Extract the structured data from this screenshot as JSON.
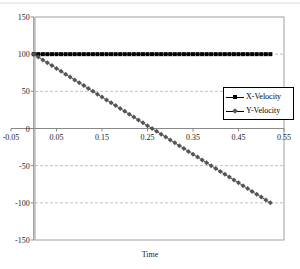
{
  "chart_data": {
    "type": "line",
    "title": "",
    "xlabel": "Time",
    "ylabel": "",
    "xlim": [
      -0.05,
      0.55
    ],
    "ylim": [
      -150,
      150
    ],
    "x_ticks": [
      -0.05,
      0.05,
      0.15,
      0.25,
      0.35,
      0.45,
      0.55
    ],
    "x_tick_labels": [
      "-0.05",
      "0.05",
      "0.15",
      "0.25",
      "0.35",
      "0.45",
      "0.55"
    ],
    "y_ticks": [
      -150,
      -100,
      -50,
      0,
      50,
      100,
      150
    ],
    "y_tick_labels": [
      "-150",
      "-100",
      "-50",
      "0",
      "50",
      "100",
      "150"
    ],
    "grid": {
      "horizontal": true,
      "style": "dashed",
      "color": "#b0b0b0"
    },
    "legend_position": "right-middle",
    "x": [
      0.0,
      0.01,
      0.02,
      0.03,
      0.04,
      0.05,
      0.06,
      0.07,
      0.08,
      0.09,
      0.1,
      0.11,
      0.12,
      0.13,
      0.14,
      0.15,
      0.16,
      0.17,
      0.18,
      0.19,
      0.2,
      0.21,
      0.22,
      0.23,
      0.24,
      0.25,
      0.26,
      0.27,
      0.28,
      0.29,
      0.3,
      0.31,
      0.32,
      0.33,
      0.34,
      0.35,
      0.36,
      0.37,
      0.38,
      0.39,
      0.4,
      0.41,
      0.42,
      0.43,
      0.44,
      0.45,
      0.46,
      0.47,
      0.48,
      0.49,
      0.5,
      0.51,
      0.52
    ],
    "series": [
      {
        "name": "X-Velocity",
        "marker": "square",
        "color": "#000000",
        "values": [
          100,
          100,
          100,
          100,
          100,
          100,
          100,
          100,
          100,
          100,
          100,
          100,
          100,
          100,
          100,
          100,
          100,
          100,
          100,
          100,
          100,
          100,
          100,
          100,
          100,
          100,
          100,
          100,
          100,
          100,
          100,
          100,
          100,
          100,
          100,
          100,
          100,
          100,
          100,
          100,
          100,
          100,
          100,
          100,
          100,
          100,
          100,
          100,
          100,
          100,
          100,
          100,
          100
        ]
      },
      {
        "name": "Y-Velocity",
        "marker": "diamond",
        "color": "#555555",
        "values": [
          100.0,
          96.2,
          92.3,
          88.5,
          84.6,
          80.8,
          76.9,
          73.1,
          69.2,
          65.4,
          61.5,
          57.7,
          53.8,
          50.0,
          46.2,
          42.3,
          38.5,
          34.6,
          30.8,
          26.9,
          23.1,
          19.2,
          15.4,
          11.5,
          7.7,
          3.8,
          0.0,
          -3.8,
          -7.7,
          -11.5,
          -15.4,
          -19.2,
          -23.1,
          -26.9,
          -30.8,
          -34.6,
          -38.5,
          -42.3,
          -46.2,
          -50.0,
          -53.8,
          -57.7,
          -61.5,
          -65.4,
          -69.2,
          -73.1,
          -76.9,
          -80.8,
          -84.6,
          -88.5,
          -92.3,
          -96.2,
          -100.0
        ]
      }
    ]
  },
  "legend": {
    "items": [
      {
        "label": "X-Velocity"
      },
      {
        "label": "Y-Velocity"
      }
    ]
  },
  "axes": {
    "xlabel": "Time"
  }
}
